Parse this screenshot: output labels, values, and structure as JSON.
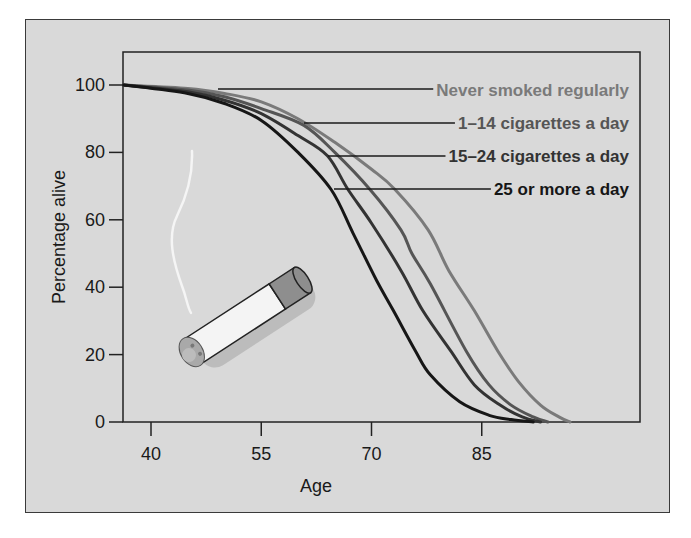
{
  "chart_data": {
    "type": "line",
    "title": "",
    "xlabel": "Age",
    "ylabel": "Percentage alive",
    "xlim": [
      36.3,
      106
    ],
    "ylim": [
      0,
      110
    ],
    "x_ticks": [
      40,
      55,
      70,
      85
    ],
    "y_ticks": [
      0,
      20,
      40,
      60,
      80,
      100
    ],
    "grid": false,
    "legend_position": "upper right, labels with leader lines to curves",
    "series": [
      {
        "name": "Never smoked regularly",
        "color": "#7a7a7a",
        "points": [
          [
            36.3,
            100
          ],
          [
            45,
            99
          ],
          [
            50,
            97.5
          ],
          [
            55,
            95
          ],
          [
            60,
            90
          ],
          [
            65,
            83
          ],
          [
            70,
            75
          ],
          [
            73.2,
            69
          ],
          [
            77.7,
            57
          ],
          [
            80.5,
            45
          ],
          [
            84,
            33
          ],
          [
            87.2,
            21
          ],
          [
            90,
            12
          ],
          [
            93,
            5
          ],
          [
            95.5,
            1.5
          ],
          [
            97,
            0
          ]
        ]
      },
      {
        "name": "1–14 cigarettes a day",
        "color": "#555555",
        "points": [
          [
            36.3,
            100
          ],
          [
            45,
            98.5
          ],
          [
            50,
            96.5
          ],
          [
            55,
            93
          ],
          [
            60.8,
            88
          ],
          [
            65,
            80
          ],
          [
            69.8,
            69
          ],
          [
            74,
            57
          ],
          [
            75.5,
            50
          ],
          [
            78,
            41
          ],
          [
            82.9,
            21
          ],
          [
            86,
            11
          ],
          [
            89,
            5
          ],
          [
            92,
            1.5
          ],
          [
            94,
            0
          ]
        ]
      },
      {
        "name": "15–24 cigarettes a day",
        "color": "#333333",
        "points": [
          [
            36.3,
            100
          ],
          [
            45,
            98
          ],
          [
            50,
            95.5
          ],
          [
            55,
            91.5
          ],
          [
            60,
            85
          ],
          [
            64,
            79
          ],
          [
            66.8,
            69
          ],
          [
            70,
            59
          ],
          [
            74,
            45
          ],
          [
            77,
            33
          ],
          [
            80.8,
            21
          ],
          [
            84,
            11
          ],
          [
            87.5,
            5
          ],
          [
            90.5,
            1.5
          ],
          [
            93,
            0
          ]
        ]
      },
      {
        "name": "25 or more a day",
        "color": "#161616",
        "points": [
          [
            36.3,
            100
          ],
          [
            45,
            97.5
          ],
          [
            50,
            94.5
          ],
          [
            55,
            89.5
          ],
          [
            60,
            80
          ],
          [
            64.5,
            69
          ],
          [
            67.5,
            56
          ],
          [
            70.7,
            42
          ],
          [
            73,
            33
          ],
          [
            76,
            21
          ],
          [
            78,
            14
          ],
          [
            82,
            6
          ],
          [
            86,
            2
          ],
          [
            89,
            0.7
          ],
          [
            92,
            0
          ]
        ]
      }
    ],
    "legend_leaders": [
      {
        "label_index": 0,
        "label_xy": [
          376,
          89
        ],
        "line_y": 88,
        "line_x_start": 217
      },
      {
        "label_index": 1,
        "label_xy": [
          376,
          122
        ],
        "line_y": 122,
        "line_x_start": 303
      },
      {
        "label_index": 2,
        "label_xy": [
          376,
          155
        ],
        "line_y": 155,
        "line_x_start": 327
      },
      {
        "label_index": 3,
        "label_xy": [
          376,
          188
        ],
        "line_y": 188,
        "line_x_start": 333
      }
    ]
  },
  "illustration": {
    "name": "lit cigarette with smoke",
    "filter_color": "#8e8e8e",
    "paper_color": "#f4f4f4",
    "ash_color": "#a9a9a9"
  }
}
